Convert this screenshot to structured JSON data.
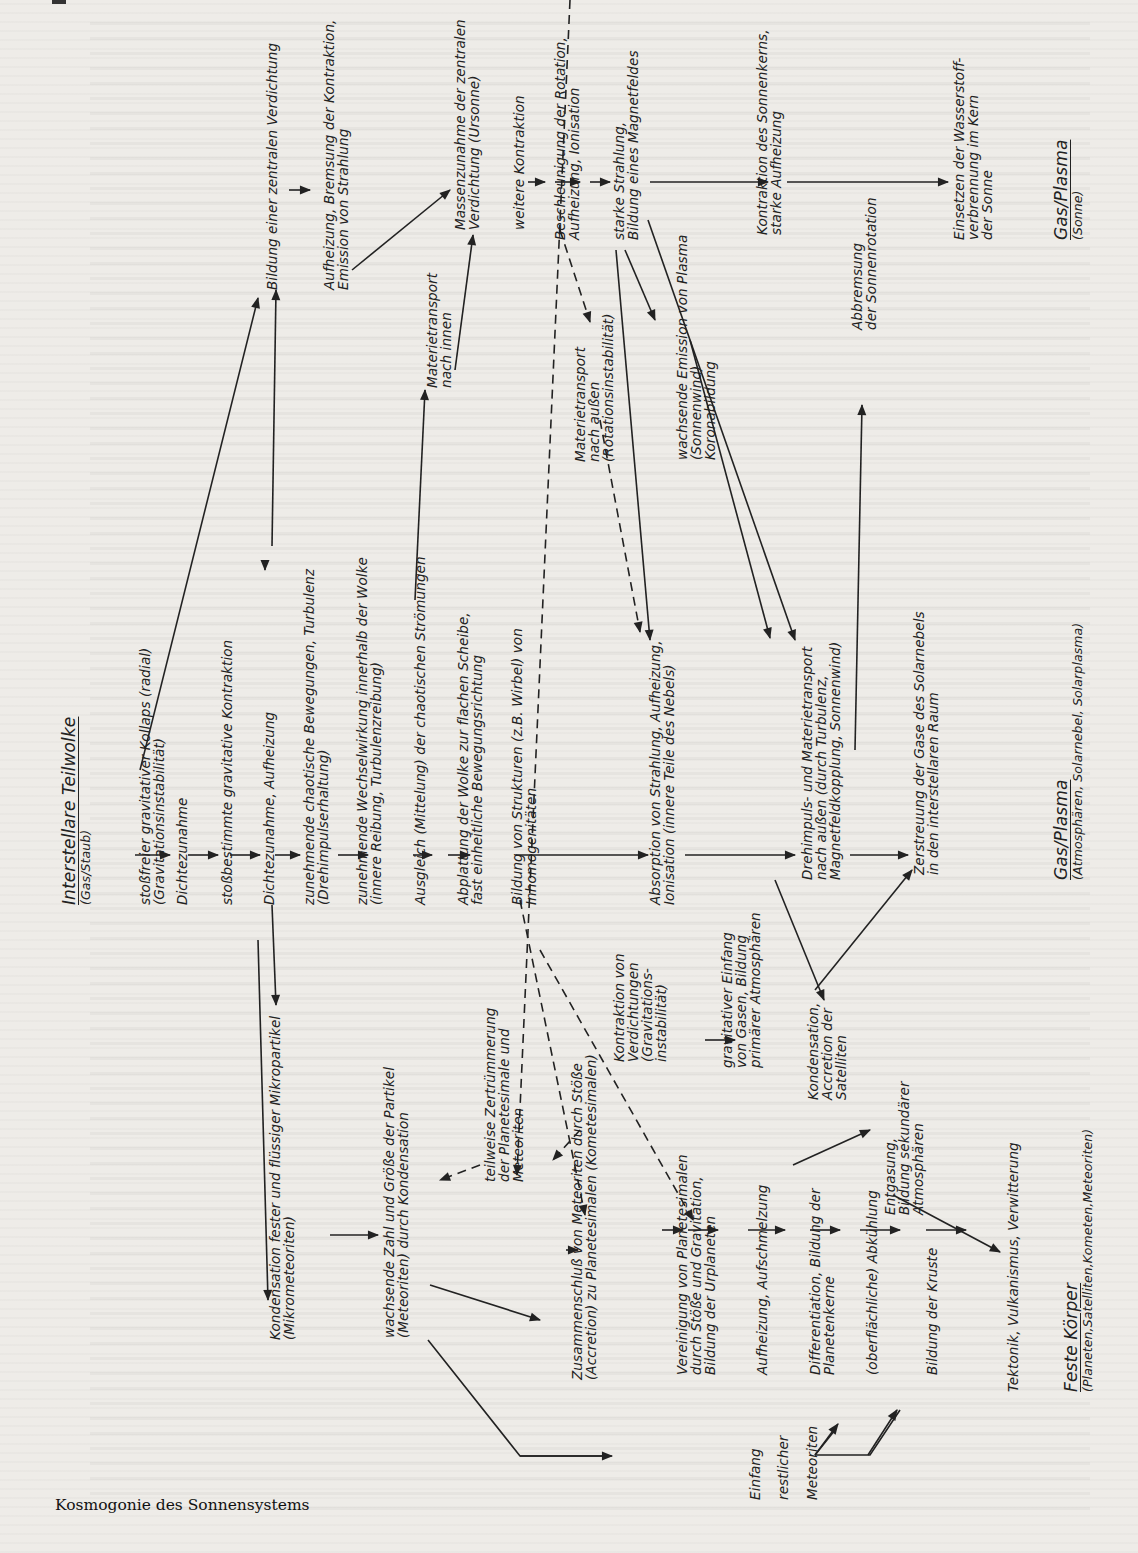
{
  "caption": "Kosmogonie des Sonnensystems",
  "categories": {
    "start": {
      "title": "Interstellare Teilwolke",
      "subtitle": "(Gas/Staub)"
    },
    "sun": {
      "title": "Gas/Plasma",
      "subtitle": "(Sonne)"
    },
    "gas": {
      "title": "Gas/Plasma",
      "subtitle": "(Atmosphären, Solarnebel, Solarplasma)"
    },
    "solid": {
      "title": "Feste Körper",
      "subtitle": "(Planeten,Satelliten,Kometen,Meteoriten)"
    }
  },
  "nodes": {
    "collapse": [
      "stoßfreier gravitativer Kollaps (radial)",
      "(Gravitationsinstabilität)"
    ],
    "density1": [
      "Dichtezunahme"
    ],
    "contraction": [
      "stoßbestimmte gravitative Kontraktion"
    ],
    "density2": [
      "Dichtezunahme, Aufheizung"
    ],
    "chaotic": [
      "zunehmende chaotische Bewegungen, Turbulenz",
      "(Drehimpulserhaltung)"
    ],
    "interaction": [
      "zunehmende Wechselwirkung innerhalb der Wolke",
      "(innere Reibung, Turbulenzreibung)"
    ],
    "balance": [
      "Ausgleich (Mittelung) der chaotischen Strömungen"
    ],
    "flatten": [
      "Abplattung der Wolke zur flachen Scheibe,",
      "fast einheitliche Bewegungsrichtung"
    ],
    "structures": [
      "Bildung von Strukturen (z.B. Wirbel) von",
      "Inhomogenitäten"
    ],
    "absorption": [
      "Absorption von Strahlung, Aufheizung,",
      "Ionisation (innere Teile des Nebels)"
    ],
    "angular": [
      "Drehimpuls- und Materietransport",
      "nach außen (durch Turbulenz,",
      "Magnetfeldkopplung, Sonnenwind)"
    ],
    "dispersal": [
      "Zerstreuung der Gase des Solarnebels",
      "in den interstellaren Raum"
    ],
    "central": [
      "Bildung einer zentralen Verdichtung"
    ],
    "heating": [
      "Aufheizung, Bremsung der Kontraktion,",
      "Emission von Strahlung"
    ],
    "inward": [
      "Materietransport",
      "nach innen"
    ],
    "mass": [
      "Massenzunahme der zentralen",
      "Verdichtung (Ursonne)"
    ],
    "further": [
      "weitere Kontraktion"
    ],
    "rotation": [
      "Beschleunigung der Rotation,",
      "Aufheizung, Ionisation"
    ],
    "outward": [
      "Materietransport",
      "nach außen",
      "(Rotationsinstabilität)"
    ],
    "radiation": [
      "starke Strahlung,",
      "Bildung eines Magnetfeldes"
    ],
    "plasma": [
      "wachsende Emission von Plasma",
      "(Sonnenwind)",
      "Koronabildung"
    ],
    "core": [
      "Kontraktion des Sonnenkerns,",
      "starke Aufheizung"
    ],
    "braking": [
      "Abbremsung",
      "der Sonnenrotation"
    ],
    "hydrogen": [
      "Einsetzen der Wasserstoff-",
      "verbrennung im Kern",
      "der Sonne"
    ],
    "condensation": [
      "Kondensation fester und flüssiger Mikropartikel",
      "(Mikrometeoriten)"
    ],
    "growth": [
      "wachsende Zahl und Größe der Partikel",
      "(Meteoriten) durch Kondensation"
    ],
    "fragment": [
      "teilweise Zertrümmerung",
      "der Planetesimale und",
      "Meteoriten"
    ],
    "accretion": [
      "Zusammenschluß von Meteoriten durch Stöße",
      "(Accretion) zu Planetesimalen (Kometesimalen)"
    ],
    "condens_contr": [
      "Kontraktion von",
      "Verdichtungen",
      "(Gravitations-",
      "instabilität)"
    ],
    "capture": [
      "gravitativer Einfang",
      "von Gasen, Bildung",
      "primärer Atmosphären"
    ],
    "satellites": [
      "Kondensation,",
      "Accretion der",
      "Satelliten"
    ],
    "union": [
      "Vereinigung von Planetesimalen",
      "durch Stöße und Gravitation,",
      "Bildung der Urplaneten"
    ],
    "melt": [
      "Aufheizung, Aufschmelzung"
    ],
    "diff": [
      "Differentiation, Bildung der",
      "Planetenkerne"
    ],
    "outgas": [
      "Entgasung,",
      "Bildung sekundärer",
      "Atmosphären"
    ],
    "cooling": [
      "(oberflächliche) Abkühlung"
    ],
    "crust": [
      "Bildung der Kruste"
    ],
    "tectonic": [
      "Tektonik, Vulkanismus, Verwitterung"
    ],
    "capture_rest": [
      "Einfang",
      "restlicher",
      "Meteoriten"
    ]
  }
}
